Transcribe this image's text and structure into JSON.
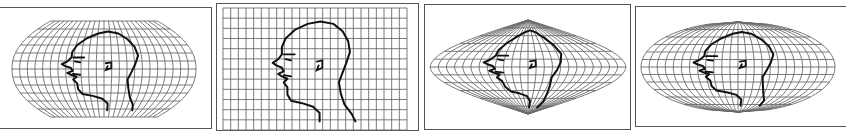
{
  "figure": {
    "colors": {
      "grid": "#6a6a6a",
      "head": "#111111",
      "frame": "#555555",
      "background": "#ffffff"
    },
    "panels": [
      {
        "id": "p1",
        "projection": "robinson-like (pseudocylindrical, flat poles)",
        "meridians": 24,
        "parallels": 12
      },
      {
        "id": "p2",
        "projection": "cylindrical (rectangular grid)",
        "meridians": 24,
        "parallels": 12
      },
      {
        "id": "p3",
        "projection": "sinusoidal-like (pointed poles)",
        "meridians": 24,
        "parallels": 12
      },
      {
        "id": "p4",
        "projection": "mollweide-like (elliptical)",
        "meridians": 24,
        "parallels": 12
      }
    ]
  }
}
